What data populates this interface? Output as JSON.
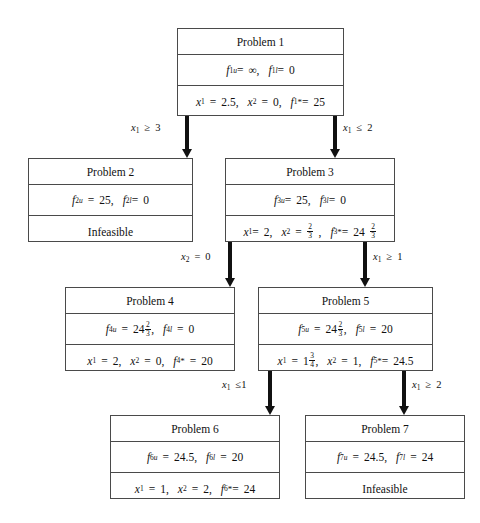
{
  "diagram": {
    "nodes": [
      {
        "id": "p1",
        "title": "Problem 1",
        "bounds": {
          "upper_label": "f",
          "upper_sub": "1",
          "upper_sup": "u",
          "upper_value": "∞",
          "lower_sub": "1",
          "lower_sup": "l",
          "lower_value": "0"
        },
        "solution": {
          "x1": "2.5",
          "x2": "0",
          "obj_sub": "1",
          "obj_value": "25"
        },
        "status": ""
      },
      {
        "id": "p2",
        "title": "Problem 2",
        "bounds": {
          "upper_label": "f",
          "upper_sub": "2",
          "upper_sup": "u",
          "upper_value": "25",
          "lower_sub": "2",
          "lower_sup": "l",
          "lower_value": "0"
        },
        "solution": null,
        "status": "Infeasible"
      },
      {
        "id": "p3",
        "title": "Problem 3",
        "bounds": {
          "upper_label": "f",
          "upper_sub": "3",
          "upper_sup": "u",
          "upper_value": "25",
          "lower_sub": "3",
          "lower_sup": "l",
          "lower_value": "0"
        },
        "solution": {
          "x1": "2",
          "x2": "2/3",
          "obj_sub": "3",
          "obj_value": "24 2/3"
        },
        "status": ""
      },
      {
        "id": "p4",
        "title": "Problem 4",
        "bounds": {
          "upper_label": "f",
          "upper_sub": "4",
          "upper_sup": "u",
          "upper_value": "24 2/3",
          "lower_sub": "4",
          "lower_sup": "l",
          "lower_value": "0"
        },
        "solution": {
          "x1": "2",
          "x2": "0",
          "obj_sub": "4",
          "obj_value": "20"
        },
        "status": ""
      },
      {
        "id": "p5",
        "title": "Problem 5",
        "bounds": {
          "upper_label": "f",
          "upper_sub": "5",
          "upper_sup": "u",
          "upper_value": "24 2/3",
          "lower_sub": "5",
          "lower_sup": "l",
          "lower_value": "20"
        },
        "solution": {
          "x1": "1 3/4",
          "x2": "1",
          "obj_sub": "5",
          "obj_value": "24.5"
        },
        "status": ""
      },
      {
        "id": "p6",
        "title": "Problem 6",
        "bounds": {
          "upper_label": "f",
          "upper_sub": "6",
          "upper_sup": "u",
          "upper_value": "24.5",
          "lower_sub": "6",
          "lower_sup": "l",
          "lower_value": "20"
        },
        "solution": {
          "x1": "1",
          "x2": "2",
          "obj_sub": "6",
          "obj_value": "24"
        },
        "status": ""
      },
      {
        "id": "p7",
        "title": "Problem 7",
        "bounds": {
          "upper_label": "f",
          "upper_sub": "7",
          "upper_sup": "u",
          "upper_value": "24.5",
          "lower_sub": "7",
          "lower_sup": "l",
          "lower_value": "24"
        },
        "solution": null,
        "status": "Infeasible"
      }
    ],
    "branch_labels": [
      {
        "id": "b1-left",
        "var": "x",
        "sub": "1",
        "rel": "≥",
        "value": "3",
        "from": "p1",
        "to": "p2"
      },
      {
        "id": "b1-right",
        "var": "x",
        "sub": "1",
        "rel": "≤",
        "value": "2",
        "from": "p1",
        "to": "p3"
      },
      {
        "id": "b3-left",
        "var": "x",
        "sub": "2",
        "rel": "=",
        "value": "0",
        "from": "p3",
        "to": "p4"
      },
      {
        "id": "b3-right",
        "var": "x",
        "sub": "1",
        "rel": "≥",
        "value": "1",
        "from": "p3",
        "to": "p5"
      },
      {
        "id": "b5-left",
        "var": "x",
        "sub": "1",
        "rel": "≤",
        "value": "1",
        "from": "p5",
        "to": "p6"
      },
      {
        "id": "b5-right",
        "var": "x",
        "sub": "1",
        "rel": "≥",
        "value": "2",
        "from": "p5",
        "to": "p7"
      }
    ],
    "labels": {
      "equals": "=",
      "comma": ",",
      "infinity": "∞",
      "star": "*",
      "sup_upper": "u",
      "sup_lower": "l"
    },
    "colors": {
      "box_border": "#4a4a4a",
      "arrow": "#111111",
      "background": "#ffffff",
      "text": "#111111"
    }
  }
}
